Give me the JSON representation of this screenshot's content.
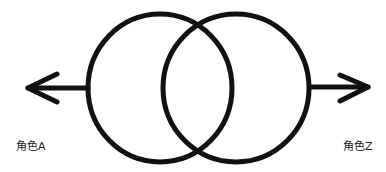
{
  "diagram": {
    "type": "overlapping-circles-with-arrows",
    "labels": {
      "left": "角色A",
      "right": "角色Z"
    },
    "colors": {
      "stroke": "#111111",
      "background": "#ffffff",
      "text": "#222222"
    },
    "circles": [
      {
        "cx": 160,
        "cy": 88,
        "r": 73
      },
      {
        "cx": 236,
        "cy": 88,
        "r": 73
      }
    ],
    "arrows": [
      {
        "direction": "left",
        "from_x": 88,
        "to_x": 25,
        "y": 88
      },
      {
        "direction": "right",
        "from_x": 310,
        "to_x": 370,
        "y": 87
      }
    ]
  }
}
